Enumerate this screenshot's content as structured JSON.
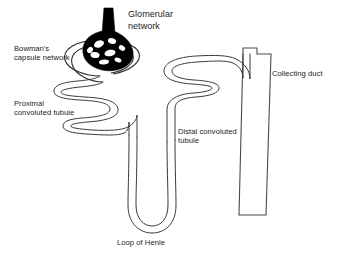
{
  "diagram": {
    "background_color": "#ffffff",
    "line_color": "#3a3a3a",
    "text_color": "#1c1c1c",
    "glomerulus_color": "#000000",
    "labels": {
      "glomerular_network": "Glomerular\nnetwork",
      "bowmans_capsule": "Bowman's\ncapsule network",
      "proximal_tubule": "Proximal\nconvoluted tubule",
      "distal_tubule": "Distal convoluted\ntubule",
      "collecting_duct": "Collecting duct",
      "loop_of_henle": "Loop of Henle"
    }
  }
}
